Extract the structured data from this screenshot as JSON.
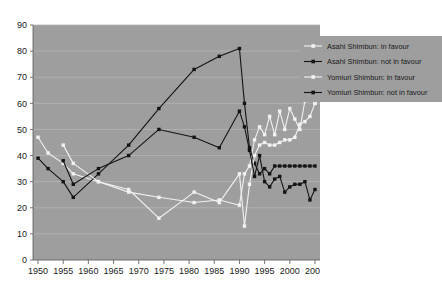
{
  "chart_data": {
    "type": "line",
    "title": "",
    "subtitle": "",
    "xlabel": "",
    "ylabel": "",
    "xlim": [
      1949,
      2006
    ],
    "ylim": [
      0,
      90
    ],
    "ytick_step": 10,
    "grid": true,
    "legend_position": "top-right",
    "plot_background": "#9e9e9e",
    "page_background": "#ffffff",
    "xticks": [
      1950,
      1955,
      1960,
      1965,
      1970,
      1975,
      1980,
      1985,
      1990,
      1995,
      2000,
      2005
    ],
    "ytick_labels": [
      "0",
      "10",
      "20",
      "30",
      "40",
      "50",
      "60",
      "70",
      "80",
      "90"
    ],
    "series": [
      {
        "name": "Asahi Shimbun: in favour",
        "color": "#f2f2f2",
        "marker": "square",
        "x": [
          1950,
          1952,
          1955,
          1957,
          1962,
          1968,
          1974,
          1981,
          1986,
          1990,
          1991,
          1992,
          1993,
          1994,
          1995,
          1996,
          1997,
          1998,
          1999,
          2000,
          2001,
          2002,
          2003,
          2004,
          2005
        ],
        "y": [
          47,
          41,
          37,
          33,
          30,
          26,
          24,
          22,
          23,
          21,
          33,
          36,
          46,
          51,
          48,
          55,
          48,
          57,
          50,
          58,
          54,
          50,
          61,
          65,
          60
        ]
      },
      {
        "name": "Asahi Shimbun: not in favour",
        "color": "#141414",
        "marker": "square",
        "x": [
          1950,
          1952,
          1955,
          1957,
          1962,
          1968,
          1974,
          1981,
          1986,
          1990,
          1991,
          1992,
          1993,
          1994,
          1995,
          1996,
          1997,
          1998,
          1999,
          2000,
          2001,
          2002,
          2003,
          2004,
          2005
        ],
        "y": [
          39,
          35,
          30,
          24,
          33,
          44,
          58,
          73,
          78,
          81,
          60,
          43,
          37,
          33,
          35,
          33,
          36,
          36,
          36,
          36,
          36,
          36,
          36,
          36,
          36
        ]
      },
      {
        "name": "Yomiuri Shimbun: in favour",
        "color": "#f2f2f2",
        "marker": "square",
        "x": [
          1955,
          1957,
          1962,
          1968,
          1974,
          1981,
          1986,
          1990,
          1991,
          1992,
          1993,
          1994,
          1995,
          1996,
          1997,
          1998,
          1999,
          2000,
          2001,
          2002,
          2003,
          2004,
          2005
        ],
        "y": [
          44,
          37,
          30,
          27,
          16,
          26,
          22,
          33,
          13,
          29,
          40,
          44,
          45,
          44,
          44,
          45,
          46,
          46,
          47,
          52,
          53,
          55,
          60
        ]
      },
      {
        "name": "Yomiuri Shimbun: not in favour",
        "color": "#141414",
        "marker": "square",
        "x": [
          1955,
          1957,
          1962,
          1968,
          1974,
          1981,
          1986,
          1990,
          1991,
          1992,
          1993,
          1994,
          1995,
          1996,
          1997,
          1998,
          1999,
          2000,
          2001,
          2002,
          2003,
          2004,
          2005
        ],
        "y": [
          38,
          29,
          35,
          40,
          50,
          47,
          43,
          57,
          51,
          42,
          32,
          40,
          30,
          28,
          31,
          32,
          26,
          28,
          29,
          29,
          30,
          23,
          27
        ]
      }
    ],
    "legend": [
      {
        "label": "Asahi Shimbun: in favour",
        "color": "#f2f2f2"
      },
      {
        "label": "Asahi Shimbun: not in favour",
        "color": "#141414"
      },
      {
        "label": "Yomiuri Shimbun: in favour",
        "color": "#f2f2f2"
      },
      {
        "label": "Yomiuri Shimbun: not in favour",
        "color": "#141414"
      }
    ]
  }
}
